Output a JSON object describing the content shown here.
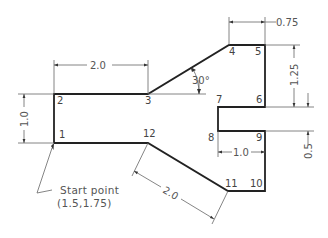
{
  "diagram": {
    "shape_points": [
      {
        "id": "1",
        "label": "1"
      },
      {
        "id": "2",
        "label": "2"
      },
      {
        "id": "3",
        "label": "3"
      },
      {
        "id": "4",
        "label": "4"
      },
      {
        "id": "5",
        "label": "5"
      },
      {
        "id": "6",
        "label": "6"
      },
      {
        "id": "7",
        "label": "7"
      },
      {
        "id": "8",
        "label": "8"
      },
      {
        "id": "9",
        "label": "9"
      },
      {
        "id": "10",
        "label": "10"
      },
      {
        "id": "11",
        "label": "11"
      },
      {
        "id": "12",
        "label": "12"
      }
    ],
    "dimensions": {
      "top_width": "2.0",
      "left_height": "1.0",
      "angle": "30°",
      "top_right_width": "0.75",
      "right_height": "1.25",
      "notch_width": "1.0",
      "notch_height": "0.5",
      "diagonal_length": "2.0"
    },
    "start_note": {
      "line1": "Start point",
      "line2": "(1.5,1.75)"
    }
  }
}
